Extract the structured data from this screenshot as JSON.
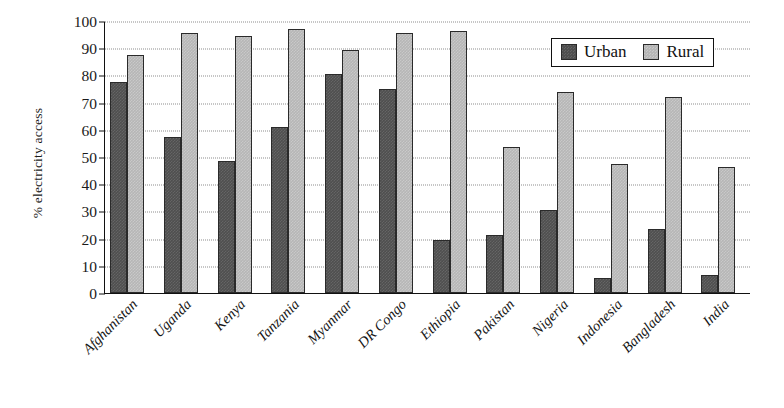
{
  "chart_data": {
    "type": "bar",
    "title": "",
    "subtitle": "",
    "xlabel": "",
    "ylabel": "% electricity access",
    "ylim": [
      0,
      100
    ],
    "ytick_step": 10,
    "yticks": [
      100,
      90,
      80,
      70,
      60,
      50,
      40,
      30,
      20,
      10,
      0
    ],
    "grid": true,
    "grid_style": "dotted-horizontal",
    "legend_position": "top-right",
    "categories": [
      "Afghanistan",
      "Uganda",
      "Kenya",
      "Tanzania",
      "Myanmar",
      "DR Congo",
      "Ethiopia",
      "Pakistan",
      "Nigeria",
      "Indonesia",
      "Bangladesh",
      "India"
    ],
    "series": [
      {
        "name": "Urban",
        "color": "#4f4f4f",
        "values": [
          77.5,
          57.5,
          48.5,
          61.0,
          80.5,
          75.0,
          19.5,
          21.5,
          30.5,
          5.5,
          23.5,
          6.5
        ]
      },
      {
        "name": "Rural",
        "color": "#b6b6b6",
        "values": [
          87.5,
          95.5,
          94.5,
          97.0,
          89.5,
          95.5,
          96.5,
          53.5,
          74.0,
          47.5,
          72.0,
          46.5
        ]
      }
    ]
  },
  "legend": {
    "items": [
      {
        "label": "Urban",
        "swatch": "urban-swatch-icon"
      },
      {
        "label": "Rural",
        "swatch": "rural-swatch-icon"
      }
    ]
  }
}
